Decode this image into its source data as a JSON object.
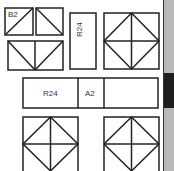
{
  "diagram": {
    "cells": [
      {
        "id": "b2",
        "label": "B2"
      },
      {
        "id": "r24-vertical",
        "label": "R24"
      },
      {
        "id": "r24-horizontal",
        "label": "R24"
      },
      {
        "id": "a2",
        "label": "A2"
      }
    ],
    "colors": {
      "line": "#222222",
      "strip": "#b9b9b9",
      "strip_band": "#1e1e1e"
    }
  }
}
